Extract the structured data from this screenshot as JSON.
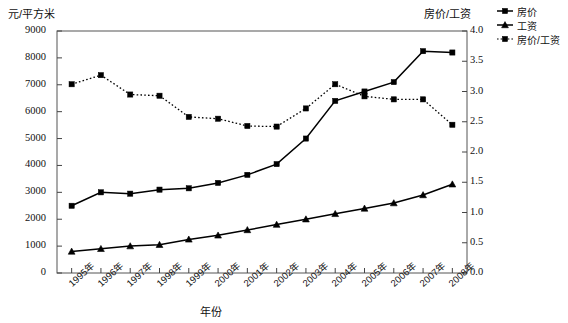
{
  "chart_data": {
    "type": "line",
    "title": "",
    "xlabel": "年份",
    "ylabel": "元/平方米",
    "ylabel_right": "房价/工资",
    "categories": [
      "1995年",
      "1996年",
      "1997年",
      "1998年",
      "1999年",
      "2000年",
      "2001年",
      "2002年",
      "2003年",
      "2004年",
      "2005年",
      "2006年",
      "2007年",
      "2008年"
    ],
    "ylim": [
      0,
      9000
    ],
    "yticks": [
      "0",
      "1000",
      "2000",
      "3000",
      "4000",
      "5000",
      "6000",
      "7000",
      "8000",
      "9000"
    ],
    "ylim_right": [
      0,
      4.0
    ],
    "yticks_right": [
      "0.0",
      "0.5",
      "1.0",
      "1.5",
      "2.0",
      "2.5",
      "3.0",
      "3.5",
      "4.0"
    ],
    "grid": false,
    "legend_position": "top-right",
    "series": [
      {
        "name": "房价",
        "axis": "left",
        "marker": "square",
        "line": "solid",
        "color": "#000000",
        "values": [
          2500,
          3000,
          2950,
          3100,
          3150,
          3350,
          3650,
          4050,
          5000,
          6400,
          6750,
          7100,
          8250,
          8200
        ]
      },
      {
        "name": "工资",
        "axis": "left",
        "marker": "triangle",
        "line": "solid",
        "color": "#000000",
        "values": [
          800,
          900,
          1000,
          1050,
          1250,
          1400,
          1600,
          1800,
          2000,
          2200,
          2400,
          2600,
          2900,
          3300
        ]
      },
      {
        "name": "房价/工资",
        "axis": "right",
        "marker": "square",
        "line": "dotted",
        "color": "#000000",
        "values": [
          3.12,
          3.27,
          2.95,
          2.93,
          2.58,
          2.55,
          2.43,
          2.42,
          2.72,
          3.12,
          2.92,
          2.87,
          2.87,
          2.45
        ]
      }
    ]
  },
  "legend": {
    "items": [
      {
        "label": "房价"
      },
      {
        "label": "工资"
      },
      {
        "label": "房价/工资"
      }
    ]
  },
  "colors": {
    "line": "#000000",
    "axis": "#4a4a4a",
    "background": "#ffffff"
  }
}
